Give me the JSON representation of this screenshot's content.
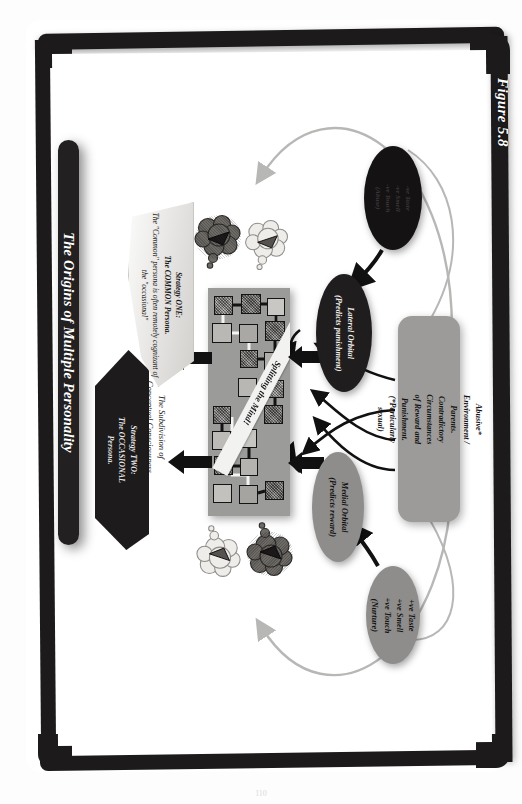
{
  "figure": {
    "label": "Figure 5.8",
    "title": "The Origins of Multiple Personality",
    "page_number": "110"
  },
  "banners": {
    "strategy_one": {
      "heading": "Strategy ONE:",
      "subheading": "The COMMON Persona.",
      "body": "The \"Common\" persona is often remotely cognizant of the \"occasional\""
    },
    "strategy_two": {
      "heading": "Strategy TWO:",
      "subheading": "The OCCASIONAL",
      "body": "Persona."
    }
  },
  "captions": {
    "subdivision_line1": "The Subdivision of",
    "subdivision_line2": "Conceptual Consciousness",
    "splitting": "Splitting the Mind!"
  },
  "nodes": {
    "lateral_orbital": {
      "line1": "Lateral Orbital",
      "line2": "(Predicts punishment)"
    },
    "medial_orbital": {
      "line1": "Medial Orbital",
      "line2": "(Predicts reward)"
    },
    "negative_senses": {
      "line1": "-ve Taste",
      "line2": "-ve Smell",
      "line3": "-ve Touch",
      "line4": "(Abuse)"
    },
    "positive_senses": {
      "line1": "+ve Taste",
      "line2": "+ve Smell",
      "line3": "+ve Touch",
      "line4": "(Nurture)"
    },
    "abusive_environment": {
      "line1": "Abusive* Environment / Parents.",
      "line2": "Contradictory Circumstances",
      "line3": "of Reward and Punishment.",
      "line4": "(*Particularly sexual)"
    }
  },
  "colors": {
    "frame": "#1c1a1b",
    "title_bar": "#232021",
    "grid_background": "#9b9b99",
    "oval_dark": "#201d1e",
    "oval_gray": "#8e8d8b",
    "infobox": "#9c9b99",
    "curve_arrow": "#b7b7b5",
    "paper": "#ffffff"
  },
  "grid": {
    "cells": [
      {
        "x": 6,
        "y": 8,
        "w": 19,
        "h": 19,
        "fill": "#8a8784",
        "tex": true
      },
      {
        "x": 33,
        "y": 6,
        "w": 20,
        "h": 20,
        "fill": "#6e6b68",
        "tex": true
      },
      {
        "x": 59,
        "y": 10,
        "w": 18,
        "h": 18,
        "fill": "#c8c7c4",
        "tex": false
      },
      {
        "x": 4,
        "y": 35,
        "w": 20,
        "h": 20,
        "fill": "#b9b8b5",
        "tex": false
      },
      {
        "x": 31,
        "y": 36,
        "w": 19,
        "h": 19,
        "fill": "#a9a8a5",
        "tex": false
      },
      {
        "x": 57,
        "y": 33,
        "w": 20,
        "h": 20,
        "fill": "#6f6c69",
        "tex": true
      },
      {
        "x": 32,
        "y": 62,
        "w": 18,
        "h": 18,
        "fill": "#76736f",
        "tex": true
      },
      {
        "x": 56,
        "y": 64,
        "w": 19,
        "h": 19,
        "fill": "#b0afac",
        "tex": false
      },
      {
        "x": 30,
        "y": 90,
        "w": 19,
        "h": 19,
        "fill": "#b8b7b4",
        "tex": false
      },
      {
        "x": 58,
        "y": 92,
        "w": 18,
        "h": 18,
        "fill": "#8d8b88",
        "tex": true
      },
      {
        "x": 56,
        "y": 117,
        "w": 19,
        "h": 19,
        "fill": "#6d6a67",
        "tex": true
      },
      {
        "x": 5,
        "y": 118,
        "w": 18,
        "h": 18,
        "fill": "#7a7774",
        "tex": true
      },
      {
        "x": 4,
        "y": 143,
        "w": 19,
        "h": 19,
        "fill": "#bcbbb8",
        "tex": false
      },
      {
        "x": 30,
        "y": 141,
        "w": 19,
        "h": 19,
        "fill": "#c6c5c2",
        "tex": false
      },
      {
        "x": 6,
        "y": 168,
        "w": 19,
        "h": 19,
        "fill": "#85827f",
        "tex": true
      },
      {
        "x": 32,
        "y": 170,
        "w": 18,
        "h": 18,
        "fill": "#b4b3b0",
        "tex": false
      },
      {
        "x": 5,
        "y": 196,
        "w": 19,
        "h": 19,
        "fill": "#c2c1be",
        "tex": false
      },
      {
        "x": 31,
        "y": 197,
        "w": 19,
        "h": 19,
        "fill": "#a5a4a1",
        "tex": false
      },
      {
        "x": 57,
        "y": 193,
        "w": 19,
        "h": 19,
        "fill": "#6b6865",
        "tex": true
      }
    ]
  },
  "clouds": [
    {
      "name": "cloud-dark-top",
      "x": 193,
      "y": 214,
      "w": 50,
      "h": 58,
      "fill": "#6e6b67",
      "dark": true,
      "flip": false
    },
    {
      "name": "cloud-light-top",
      "x": 243,
      "y": 219,
      "w": 48,
      "h": 54,
      "fill": "#eeedea",
      "dark": false,
      "flip": false
    },
    {
      "name": "cloud-light-bot",
      "x": 195,
      "y": 522,
      "w": 48,
      "h": 56,
      "fill": "#eeedea",
      "dark": false,
      "flip": true
    },
    {
      "name": "cloud-dark-bot",
      "x": 245,
      "y": 519,
      "w": 50,
      "h": 58,
      "fill": "#6e6b67",
      "dark": true,
      "flip": true
    }
  ]
}
